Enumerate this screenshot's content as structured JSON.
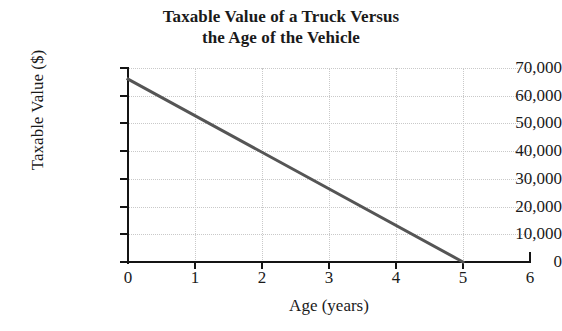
{
  "chart_data": {
    "type": "line",
    "title": "Taxable Value of a Truck Versus the Age of the Vehicle",
    "title_lines": [
      "Taxable Value of a Truck Versus",
      "the Age of the Vehicle"
    ],
    "xlabel": "Age (years)",
    "ylabel": "Taxable Value ($)",
    "xlim": [
      0,
      6
    ],
    "ylim": [
      0,
      70000
    ],
    "xticks": [
      0,
      1,
      2,
      3,
      4,
      5,
      6
    ],
    "xtick_labels": [
      "0",
      "1",
      "2",
      "3",
      "4",
      "5",
      "6"
    ],
    "yticks": [
      0,
      10000,
      20000,
      30000,
      40000,
      50000,
      60000,
      70000
    ],
    "ytick_labels": [
      "0",
      "10,000",
      "20,000",
      "30,000",
      "40,000",
      "50,000",
      "60,000",
      "70,000"
    ],
    "grid": true,
    "legend": false,
    "series": [
      {
        "name": "Taxable Value",
        "color": "#555555",
        "x": [
          0,
          5
        ],
        "values": [
          66000,
          0
        ]
      }
    ],
    "annotations": []
  },
  "colors": {
    "line": "#555555",
    "axis": "#141414",
    "grid": "#c9c9c9",
    "background": "#ffffff",
    "text": "#1a1a1a"
  }
}
